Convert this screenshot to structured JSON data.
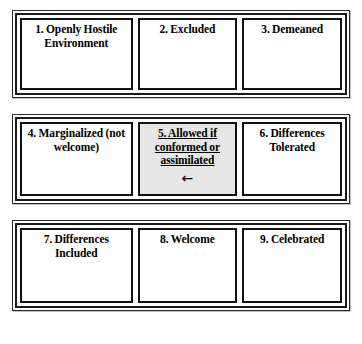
{
  "diagram": {
    "type": "matrix",
    "columns": 3,
    "rows": 3,
    "highlight_cell_number": "5",
    "highlight_background_color": "#e6e6e6",
    "frame_color": "#111111",
    "background_color": "#ffffff",
    "text_color": "#000000",
    "arrow_glyph": "←",
    "arrow_icon_name": "left-arrow-icon",
    "rows_data": [
      {
        "row_name": "row-1",
        "cells": [
          {
            "number": "1",
            "label": "1. Openly Hostile Environment",
            "highlighted": false
          },
          {
            "number": "2",
            "label": "2. Excluded",
            "highlighted": false
          },
          {
            "number": "3",
            "label": "3. Demeaned",
            "highlighted": false
          }
        ]
      },
      {
        "row_name": "row-2",
        "cells": [
          {
            "number": "4",
            "label": "4. Marginalized (not welcome)",
            "highlighted": false
          },
          {
            "number": "5",
            "label": "5. Allowed if conformed or assimilated",
            "highlighted": true
          },
          {
            "number": "6",
            "label": "6. Differences Tolerated",
            "highlighted": false
          }
        ]
      },
      {
        "row_name": "row-3",
        "cells": [
          {
            "number": "7",
            "label": "7. Differences Included",
            "highlighted": false
          },
          {
            "number": "8",
            "label": "8. Welcome",
            "highlighted": false
          },
          {
            "number": "9",
            "label": "9. Celebrated",
            "highlighted": false
          }
        ]
      }
    ]
  }
}
